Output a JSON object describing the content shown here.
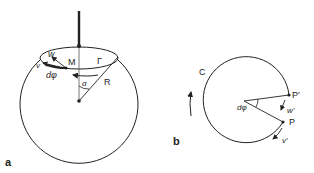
{
  "figure_a": {
    "panel_label": "a",
    "labels": {
      "w": "w",
      "v": "v",
      "M": "M",
      "dphi": "dφ",
      "Gamma": "Γ",
      "alpha": "α",
      "R": "R"
    }
  },
  "figure_b": {
    "panel_label": "b",
    "labels": {
      "C": "C",
      "P_prime": "P'",
      "P": "P",
      "w_prime": "w'",
      "v_prime": "v'",
      "dphi": "dφ"
    }
  },
  "colors": {
    "stroke": "#222222",
    "shading": "#9a9a9a"
  }
}
